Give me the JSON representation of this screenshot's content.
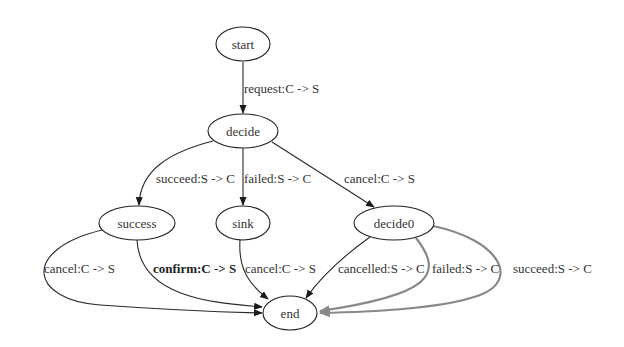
{
  "diagram": {
    "type": "state-machine",
    "nodes": [
      {
        "id": "start",
        "label": "start"
      },
      {
        "id": "decide",
        "label": "decide"
      },
      {
        "id": "success",
        "label": "success"
      },
      {
        "id": "sink",
        "label": "sink"
      },
      {
        "id": "decide0",
        "label": "decide0"
      },
      {
        "id": "end",
        "label": "end"
      }
    ],
    "edges": [
      {
        "from": "start",
        "to": "decide",
        "label": "request:C -> S"
      },
      {
        "from": "decide",
        "to": "success",
        "label": "succeed:S -> C"
      },
      {
        "from": "decide",
        "to": "sink",
        "label": "failed:S -> C"
      },
      {
        "from": "decide",
        "to": "decide0",
        "label": "cancel:C -> S"
      },
      {
        "from": "success",
        "to": "end",
        "label": "cancel:C -> S"
      },
      {
        "from": "success",
        "to": "end",
        "label": "confirm:C -> S",
        "bold": true
      },
      {
        "from": "sink",
        "to": "end",
        "label": "cancel:C -> S"
      },
      {
        "from": "decide0",
        "to": "end",
        "label": "cancelled:S -> C"
      },
      {
        "from": "decide0",
        "to": "end",
        "label": "failed:S -> C",
        "color": "#888888"
      },
      {
        "from": "decide0",
        "to": "end",
        "label": "succeed:S -> C",
        "color": "#888888"
      }
    ],
    "colors": {
      "default_edge": "#2a2a2a",
      "highlight_edge": "#888888",
      "node_stroke": "#222222"
    }
  }
}
